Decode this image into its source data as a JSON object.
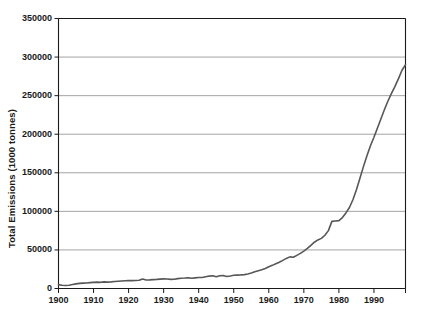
{
  "chart_data": {
    "type": "line",
    "title": "",
    "xlabel": "",
    "ylabel": "Total Emissions (1000 tonnes)",
    "xlim": [
      1900,
      1999
    ],
    "ylim": [
      0,
      350000
    ],
    "grid": "horizontal",
    "legend": "none",
    "line_color": "#575757",
    "axis_color": "#1a1a1a",
    "grid_color": "#9a9a9a",
    "background": "#ffffff",
    "yticks": [
      0,
      50000,
      100000,
      150000,
      200000,
      250000,
      300000,
      350000
    ],
    "ytick_labels": [
      "0",
      "50000",
      "100000",
      "150000",
      "200000",
      "250000",
      "300000",
      "350000"
    ],
    "xticks": [
      1900,
      1910,
      1920,
      1930,
      1940,
      1950,
      1960,
      1970,
      1980,
      1990
    ],
    "xtick_labels": [
      "1900",
      "1910",
      "1920",
      "1930",
      "1940",
      "1950",
      "1960",
      "1970",
      "1980",
      "1990"
    ],
    "series": [
      {
        "name": "Total Emissions",
        "x": [
          1900,
          1901,
          1902,
          1903,
          1904,
          1905,
          1906,
          1907,
          1908,
          1909,
          1910,
          1911,
          1912,
          1913,
          1914,
          1915,
          1916,
          1917,
          1918,
          1919,
          1920,
          1921,
          1922,
          1923,
          1924,
          1925,
          1926,
          1927,
          1928,
          1929,
          1930,
          1931,
          1932,
          1933,
          1934,
          1935,
          1936,
          1937,
          1938,
          1939,
          1940,
          1941,
          1942,
          1943,
          1944,
          1945,
          1946,
          1947,
          1948,
          1949,
          1950,
          1951,
          1952,
          1953,
          1954,
          1955,
          1956,
          1957,
          1958,
          1959,
          1960,
          1961,
          1962,
          1963,
          1964,
          1965,
          1966,
          1967,
          1968,
          1969,
          1970,
          1971,
          1972,
          1973,
          1974,
          1975,
          1976,
          1977,
          1978,
          1979,
          1980,
          1981,
          1982,
          1983,
          1984,
          1985,
          1986,
          1987,
          1988,
          1989,
          1990,
          1991,
          1992,
          1993,
          1994,
          1995,
          1996,
          1997,
          1998,
          1999
        ],
        "values": [
          5000,
          4200,
          3800,
          4200,
          5200,
          6000,
          6600,
          7000,
          7200,
          7600,
          8000,
          8200,
          8000,
          8600,
          8300,
          8600,
          9000,
          9400,
          9700,
          10000,
          10300,
          10200,
          10400,
          10600,
          12400,
          11000,
          11200,
          11500,
          11800,
          12200,
          12500,
          12300,
          11800,
          11900,
          12800,
          13300,
          13600,
          14000,
          13300,
          13800,
          14200,
          14300,
          15200,
          16100,
          16500,
          15200,
          16600,
          16800,
          15600,
          16200,
          17100,
          17400,
          17600,
          18000,
          18800,
          20000,
          21600,
          23000,
          24200,
          26000,
          28200,
          30000,
          32000,
          34000,
          36500,
          39000,
          41000,
          40500,
          43000,
          45500,
          48500,
          52000,
          56000,
          60000,
          63000,
          65000,
          69000,
          75000,
          87000,
          87500,
          88000,
          92000,
          98000,
          105000,
          115000,
          128000,
          143000,
          158000,
          172000,
          185000,
          196000,
          208000,
          220000,
          232000,
          243000,
          253000,
          262000,
          272000,
          283000,
          290000
        ]
      }
    ]
  }
}
